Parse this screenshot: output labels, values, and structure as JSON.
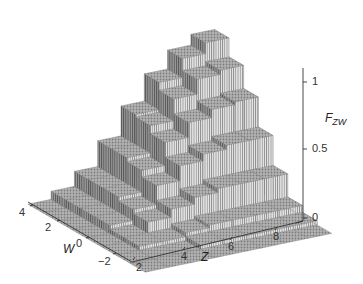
{
  "chart_data": {
    "type": "surface3d",
    "title": "",
    "xlabel": "Z",
    "ylabel": "W",
    "zlabel": "F_ZW",
    "zlabel_main": "F",
    "zlabel_sub": "ZW",
    "x_ticks": [
      "2",
      "4",
      "6",
      "8"
    ],
    "y_ticks": [
      "4",
      "2",
      "0",
      "−2"
    ],
    "z_ticks": [
      "1",
      "0.5",
      "0"
    ],
    "xlim": [
      2,
      9
    ],
    "ylim": [
      -3,
      4
    ],
    "zlim": [
      0,
      1.1
    ],
    "grid": false,
    "z_values": [
      2,
      3,
      4,
      5,
      6,
      7,
      8,
      9
    ],
    "w_values": [
      -3,
      -2,
      -1,
      0,
      1,
      2,
      3,
      4
    ],
    "values": [
      [
        0.0,
        0.0,
        0.0,
        0.0,
        0.0,
        0.0,
        0.0,
        0.0
      ],
      [
        0.0,
        0.0,
        0.03,
        0.03,
        0.06,
        0.06,
        0.06,
        0.06
      ],
      [
        0.0,
        0.0,
        0.03,
        0.11,
        0.14,
        0.17,
        0.17,
        0.17
      ],
      [
        0.0,
        0.03,
        0.06,
        0.17,
        0.28,
        0.33,
        0.36,
        0.36
      ],
      [
        0.0,
        0.03,
        0.08,
        0.22,
        0.39,
        0.5,
        0.56,
        0.58
      ],
      [
        0.0,
        0.03,
        0.08,
        0.25,
        0.44,
        0.61,
        0.72,
        0.78
      ],
      [
        0.0,
        0.03,
        0.08,
        0.25,
        0.47,
        0.67,
        0.83,
        0.92
      ],
      [
        0.0,
        0.03,
        0.08,
        0.25,
        0.47,
        0.69,
        0.86,
        1.0
      ]
    ]
  },
  "axes": {
    "z_axis_name": "Z",
    "w_axis_name": "W"
  }
}
